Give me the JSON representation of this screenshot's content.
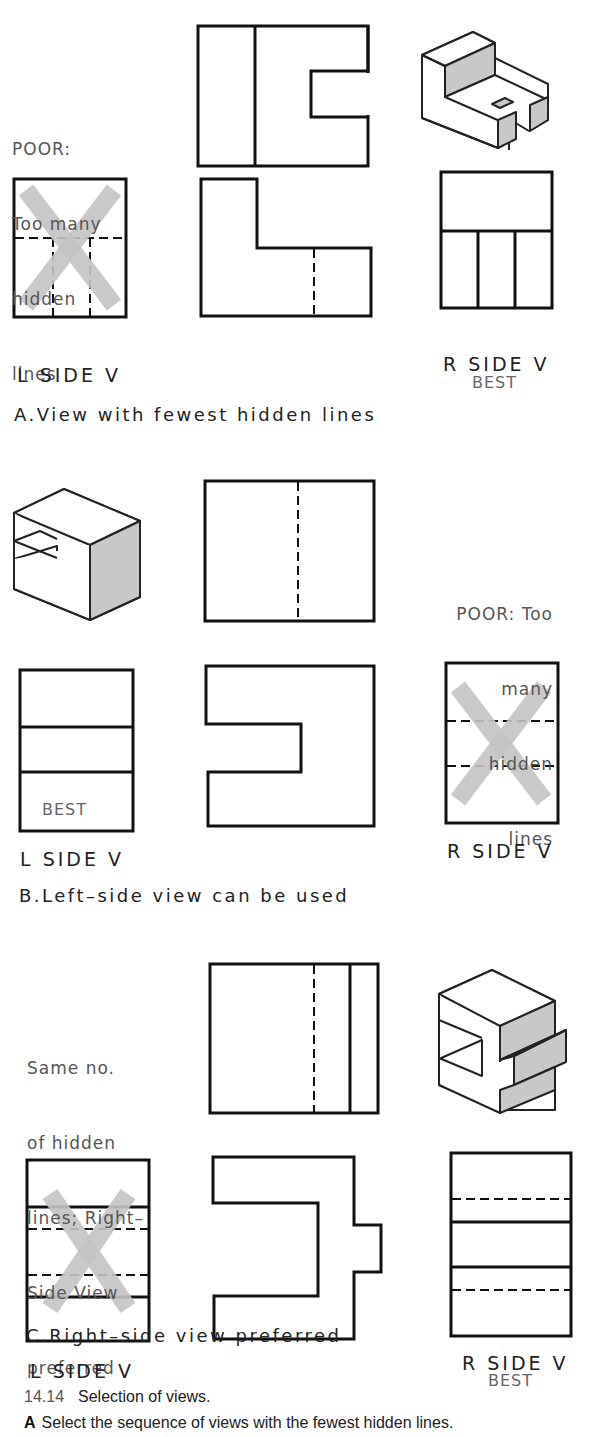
{
  "figure": {
    "number": "14.14",
    "title": "Selection of views.",
    "caption_letter": "A",
    "caption_text": "Select the sequence of views with the fewest hidden lines."
  },
  "sections": [
    {
      "id": "A",
      "caption": "A.View with fewest hidden lines",
      "note": [
        "POOR:",
        "Too many",
        "hidden",
        "lines"
      ],
      "left_label": "L SIDE V",
      "right_label": "R SIDE V",
      "best_label": "BEST",
      "best_view": "right-side",
      "crossed_view": "left-side"
    },
    {
      "id": "B",
      "caption": "B.Left–side view can be used",
      "note": [
        "POOR: Too",
        "many",
        "hidden",
        "lines"
      ],
      "left_label": "L SIDE V",
      "right_label": "R SIDE V",
      "best_label": "BEST",
      "best_view": "left-side",
      "crossed_view": "right-side"
    },
    {
      "id": "C",
      "caption": "C.Right–side view preferred",
      "note": [
        "Same no.",
        "of hidden",
        "lines; Right–",
        "Side View",
        "preferred"
      ],
      "left_label": "L SIDE V",
      "right_label": "R SIDE V",
      "best_label": "BEST",
      "best_view": "right-side",
      "crossed_view": "left-side"
    }
  ],
  "colors": {
    "line": "#111111",
    "shade": "#c8c8c8",
    "cross_mark": "#c4c4c4",
    "note_text": "#555555"
  }
}
